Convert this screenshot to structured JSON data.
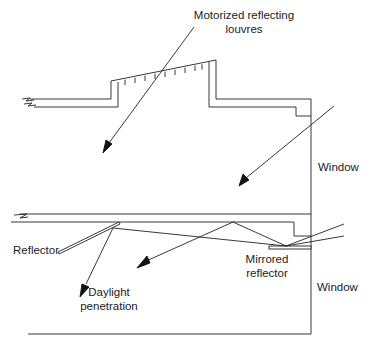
{
  "figure": {
    "type": "architectural section diagram"
  },
  "labels": {
    "louvres": [
      "Motorized reflecting",
      "louvres"
    ],
    "window_upper": "Window",
    "window_lower": "Window",
    "reflector": "Reflector",
    "mirrored_reflector": [
      "Mirrored",
      "reflector"
    ],
    "daylight": [
      "Daylight",
      "penetration"
    ]
  },
  "colors": {
    "line": "#222222",
    "background": "#ffffff"
  }
}
